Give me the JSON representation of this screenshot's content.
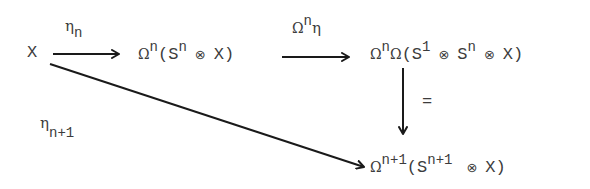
{
  "diagram": {
    "type": "commutative-diagram",
    "nodes": {
      "x": {
        "text": "X"
      },
      "top_middle": {
        "omega": "Ω",
        "omega_exp": "n",
        "open": "(S",
        "s_exp": "n",
        "otimes": "⊗",
        "close": "X)"
      },
      "top_right": {
        "omega1": "Ω",
        "omega1_exp": "n",
        "omega2": "Ω",
        "open": "(S",
        "s1_exp": "1",
        "otimes1": "⊗",
        "s2": "S",
        "s2_exp": "n",
        "otimes2": "⊗",
        "close": "X)"
      },
      "bottom_right": {
        "omega": "Ω",
        "omega_exp": "n+1",
        "open": "(S",
        "s_exp": "n+1",
        "otimes": "⊗",
        "close": "X)"
      }
    },
    "arrows": {
      "eta_n": {
        "symbol": "η",
        "subscript": "n"
      },
      "omega_n_eta": {
        "omega": "Ω",
        "exp": "n",
        "symbol": "η"
      },
      "equals": {
        "symbol": "="
      },
      "eta_n_plus_1": {
        "symbol": "η",
        "subscript": "n+1"
      }
    },
    "colors": {
      "ink": "#3c3c3c",
      "arrow": "#1a1a1a",
      "background": "#ffffff"
    }
  }
}
